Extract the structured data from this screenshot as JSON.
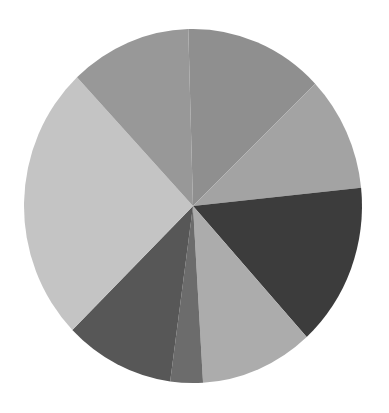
{
  "chart_data": {
    "type": "pie",
    "title": "",
    "legend": [],
    "start_angle_deg": -1.6,
    "direction": "clockwise",
    "center": [
      193,
      206
    ],
    "radius": [
      169,
      177
    ],
    "slices": [
      {
        "label": "",
        "value": 13.3,
        "color": "#8f8f8f"
      },
      {
        "label": "",
        "value": 10.5,
        "color": "#a3a3a3"
      },
      {
        "label": "",
        "value": 14.9,
        "color": "#3c3c3c"
      },
      {
        "label": "",
        "value": 10.8,
        "color": "#acacac"
      },
      {
        "label": "",
        "value": 3.1,
        "color": "#6c6c6c"
      },
      {
        "label": "",
        "value": 10.5,
        "color": "#575757"
      },
      {
        "label": "",
        "value": 25.3,
        "color": "#c4c4c4"
      },
      {
        "label": "",
        "value": 11.6,
        "color": "#989898"
      }
    ]
  }
}
